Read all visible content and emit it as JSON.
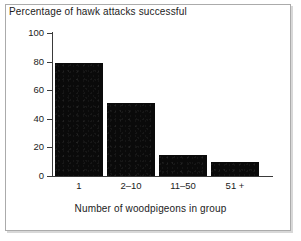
{
  "figure": {
    "title": "Percentage of hawk attacks successful"
  },
  "axes": {
    "y_tick_labels": [
      "100",
      "80",
      "60",
      "40",
      "20",
      "0"
    ],
    "x_tick_labels": [
      "1",
      "2–10",
      "11–50",
      "51 +"
    ],
    "x_axis_title": "Number of woodpigeons in group"
  },
  "style": {
    "bar_color": "#0a0a0a",
    "axis_color": "#3a3a3a",
    "frame_color": "#ababab",
    "background": "#ffffff"
  },
  "chart_data": {
    "type": "bar",
    "title": "Percentage of hawk attacks successful",
    "xlabel": "Number of woodpigeons in group",
    "ylabel": "",
    "categories": [
      "1",
      "2–10",
      "11–50",
      "51 +"
    ],
    "values": [
      79,
      51,
      15,
      10
    ],
    "ylim": [
      0,
      100
    ],
    "yticks": [
      0,
      20,
      40,
      60,
      80,
      100
    ],
    "grid": false,
    "legend": false
  }
}
